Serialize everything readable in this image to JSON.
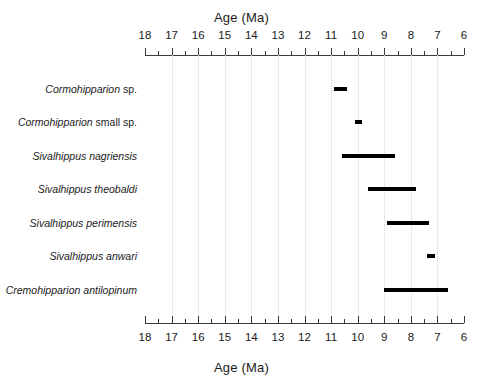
{
  "chart_data": {
    "type": "bar",
    "orientation": "horizontal",
    "title": "",
    "xlabel": "Age (Ma)",
    "ylabel": "",
    "xlim": [
      18,
      6
    ],
    "x_axis_reversed": true,
    "grid": true,
    "legend": false,
    "axis_title_top": "Age (Ma)",
    "axis_title_bottom": "Age (Ma)",
    "major_ticks": [
      18,
      17,
      16,
      15,
      14,
      13,
      12,
      11,
      10,
      9,
      8,
      7,
      6
    ],
    "minor_ticks": [
      17.5,
      16.5,
      15.5,
      14.5,
      13.5,
      12.5,
      11.5,
      10.5,
      9.5,
      8.5,
      7.5,
      6.5
    ],
    "tick_labels": [
      "18",
      "17",
      "16",
      "15",
      "14",
      "13",
      "12",
      "11",
      "10",
      "9",
      "8",
      "7",
      "6"
    ],
    "categories": [
      "Cormohipparion sp.",
      "Cormohipparion small sp.",
      "Sivalhippus nagriensis",
      "Sivalhippus theobaldi",
      "Sivalhippus perimensis",
      "Sivalhippus anwari",
      "Cremohipparion antilopinum"
    ],
    "ranges": [
      {
        "taxon": "Cormohipparion sp.",
        "start": 10.9,
        "end": 10.4
      },
      {
        "taxon": "Cormohipparion small sp.",
        "start": 10.1,
        "end": 9.85
      },
      {
        "taxon": "Sivalhippus nagriensis",
        "start": 10.6,
        "end": 8.6
      },
      {
        "taxon": "Sivalhippus theobaldi",
        "start": 9.6,
        "end": 7.8
      },
      {
        "taxon": "Sivalhippus perimensis",
        "start": 8.9,
        "end": 7.3
      },
      {
        "taxon": "Sivalhippus anwari",
        "start": 7.4,
        "end": 7.1
      },
      {
        "taxon": "Cremohipparion antilopinum",
        "start": 9.0,
        "end": 6.6
      }
    ]
  },
  "taxa": [
    {
      "genus": "Cormohipparion",
      "epithet": " sp.",
      "epithet_italic": false
    },
    {
      "genus": "Cormohipparion",
      "epithet": " small sp.",
      "epithet_italic": false
    },
    {
      "genus": "Sivalhippus",
      "epithet": " nagriensis",
      "epithet_italic": true
    },
    {
      "genus": "Sivalhippus",
      "epithet": " theobaldi",
      "epithet_italic": true
    },
    {
      "genus": "Sivalhippus",
      "epithet": " perimensis",
      "epithet_italic": true
    },
    {
      "genus": "Sivalhippus",
      "epithet": " anwari",
      "epithet_italic": true
    },
    {
      "genus": "Cremohipparion",
      "epithet": " antilopinum",
      "epithet_italic": true
    }
  ],
  "style": {
    "bar_color": "#000000",
    "axis_color": "#3a3a3a",
    "grid_color": "#d3d3d3",
    "text_color": "#1a1a1a",
    "background": "#ffffff"
  }
}
